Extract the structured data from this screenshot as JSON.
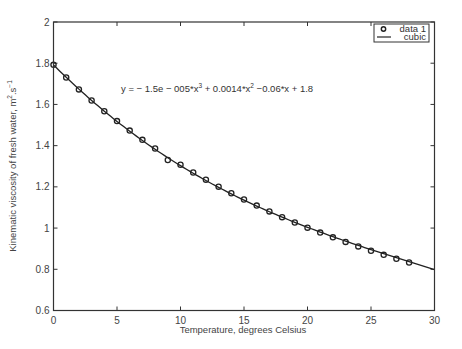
{
  "chart_data": {
    "type": "scatter",
    "title": "",
    "xlabel": "Temperature, degrees Celsius",
    "ylabel": "Kinematic viscosity of fresh water, m^2.s^-1",
    "ylabel_main": "Kinematic viscosity of fresh water, m",
    "ylabel_sup1": "2",
    "ylabel_mid": ".s",
    "ylabel_sup2": "−1",
    "xlim": [
      0,
      30
    ],
    "ylim": [
      0.6,
      2
    ],
    "xticks": [
      0,
      5,
      10,
      15,
      20,
      25,
      30
    ],
    "yticks": [
      0.6,
      0.8,
      1,
      1.2,
      1.4,
      1.6,
      1.8,
      2
    ],
    "xtick_labels": [
      "0",
      "5",
      "10",
      "15",
      "20",
      "25",
      "30"
    ],
    "ytick_labels": [
      "0.6",
      "0.8",
      "1",
      "1.2",
      "1.4",
      "1.6",
      "1.8",
      "2"
    ],
    "grid": false,
    "legend_position": "upper right",
    "series": [
      {
        "name": "data 1",
        "style": "markers-circle",
        "x": [
          0,
          1,
          2,
          3,
          4,
          5,
          6,
          7,
          8,
          9,
          10,
          11,
          12,
          13,
          14,
          15,
          16,
          17,
          18,
          19,
          20,
          21,
          22,
          23,
          24,
          25,
          26,
          27,
          28
        ],
        "values": [
          1.792,
          1.731,
          1.673,
          1.619,
          1.567,
          1.519,
          1.473,
          1.428,
          1.386,
          1.33,
          1.307,
          1.27,
          1.235,
          1.201,
          1.169,
          1.139,
          1.109,
          1.081,
          1.053,
          1.027,
          1.002,
          0.978,
          0.955,
          0.933,
          0.911,
          0.89,
          0.87,
          0.851,
          0.833
        ]
      },
      {
        "name": "cubic",
        "style": "line",
        "x_range": [
          0,
          30
        ],
        "coefficients_displayed": [
          -1.5e-05,
          0.0014,
          -0.06,
          1.8
        ],
        "render_coefficients": [
          -1.6e-05,
          0.00143,
          -0.0616,
          1.7918
        ]
      }
    ],
    "annotations": [
      {
        "text": "y = − 1.5e − 005*x^3 + 0.0014*x^2 −0.06*x + 1.8",
        "x_px": 121,
        "y_px": 92
      }
    ]
  },
  "equation": {
    "p1": "y = − 1.5e − 005*x",
    "s1": "3",
    "p2": " + 0.0014*x",
    "s2": "2",
    "p3": " −0.06*x + 1.8"
  },
  "legend": {
    "items": [
      {
        "label": "data 1",
        "icon": "circle-marker-icon"
      },
      {
        "label": "cubic",
        "icon": "line-icon"
      }
    ]
  },
  "colors": {
    "axis": "#333333",
    "series": "#222222",
    "text": "#444444",
    "background": "#ffffff"
  }
}
